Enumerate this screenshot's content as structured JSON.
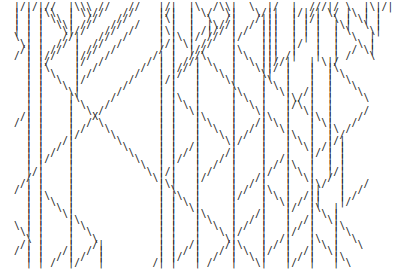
{
  "art_lines": [
    "|/|/|//  |\\\\\\ //   //   |/|  |\\  /\\\\|  \\  |/  |  ///|/ \\  |\\|/|",
    "| | |\\\\  | \\\\//   //    |/|  | \\/  \\|   \\/||  |/|/| \\/ |\\ | |",
    "| | | \\\\ |  //   //     |\\|  |  \\  /|   /|||  | |/|  \\ | \\| |",
    "| | |  \\\\| //   //  /   | |  |  |\\//|  / |||  | | |  |\\|  \\ |",
    "| | |   \\|//   //  /    |\\|  | /|// | /  |||  | | |  | \\   \\|",
    "\\ | |   //|   //  /     | |\\ |/ //  |/   |||  | | |  |  \\  |",
    " \\| |  // |  //  /      |/| \\| //   |    |||  |/  |  |   \\ |",
    " /| | //  | //  /       / |  |//    |\\   |||  |   |  |  / \\|",
    "/ | |//   |//  /       /| |  //\\    | \\  ||| /|   |  | /   \\",
    "  | |/    |/  /       / | | //| \\   |  \\ ||//|   | \\|/     ",
    "  | |\\    |  /       /  | |// |  \\  |   \\||/ |   |  |\\     ",
    "  | | \\   | /       /   | |/  |   \\ |    \\|  |   |  | \\    ",
    "  | |  \\  |/       /    |/|   |    \\|    |\\  |   |  |  \\   ",
    "  | |   \\ |       /     | |   |     \\    | \\ |   |  |   \\  ",
    "  | |    \\|      /      | |   |     |\\   |  \\|  /|  |    \\ ",
    "  | |    |\\     /       | |\\  |     | \\  |   |\\/ |  |     \\",
    "  | |    | \\   /        | | \\ |     |  \\ |   |/\\ |  |      ",
    "  | |    |  \\ /         | |  \\|     |   \\|   |  \\|  |     /",
    " /| |    |   X          | |   |\\    |    |\\  |   |\\ |    / ",
    "/ | |    |  / \\         | |   | \\   |   /| \\ |   | \\|   /  ",
    "  | |    | /   \\        | |   |  \\  |  / |  \\|   |  |\\ /   ",
    "  | |    |/     \\       | |   |   \\ | /  |   |\\  |  | /    ",
    "  | |   /|       \\      | |   |    \\|/   |   | \\ |  |/|    ",
    "  | |  / |        \\     | |  /|     |    |   |  \\| /| |    ",
    "  | | /  |         \\    | | / |    /|    |   |   |/ | |    ",
    "  | |/   |          \\   | |/  |   / |    |  /|   |  | |    ",
    "  | |    |           \\  | |   |  /  |    | / |\\  |  | |    ",
    "  |/|    |            \\ |/|   | /   |    |/  | \\ |  |/|    ",
    "  / |    |             \\| |   |/    |   /|   |  \\|  / |    ",
    " /| |    |              |\\|   |     |  / |   |   |\\/  |   /",
    "/ | |    |              | \\   |     | /  |\\  |   ||   |  / ",
    "  | |\\   |              | |\\  |     |/   | \\ |  /||   | /  ",
    "  | | \\  |              | | \\ |     |    |  \\| / ||   |/   ",
    "  | |  \\ |              | |  \\|     |    |   |/  |\\  |    ",
    "  | |   \\|              | |   |\\    |   /|   |   | \\ |    ",
    "  | |    |\\             | |   | \\   |  / |   |  /|  \\|    ",
    "\\ | |    | \\            | |   |  \\  | /  |   | / |   |\\   ",
    " \\| |    |  \\           | |   |   \\ |/   |   |/  |   | \\  ",
    "  \\ |    |   \\          | |   |    \\|    |  /|   |\\  |  \\ ",
    " /| |    |   /|         | |  /|    /|\\   | / |   | \\ |   \\",
    "/ | |   /|  / |         | | / |   / | \\  |/  |  /|  \\|    ",
    "  | |  / | /  |         | |/  |  /  |  \\ |   | / |   |\\   ",
    "  | | /  |/   |        /| |   | /   |   \\|   |/  |   | \\  "
  ]
}
